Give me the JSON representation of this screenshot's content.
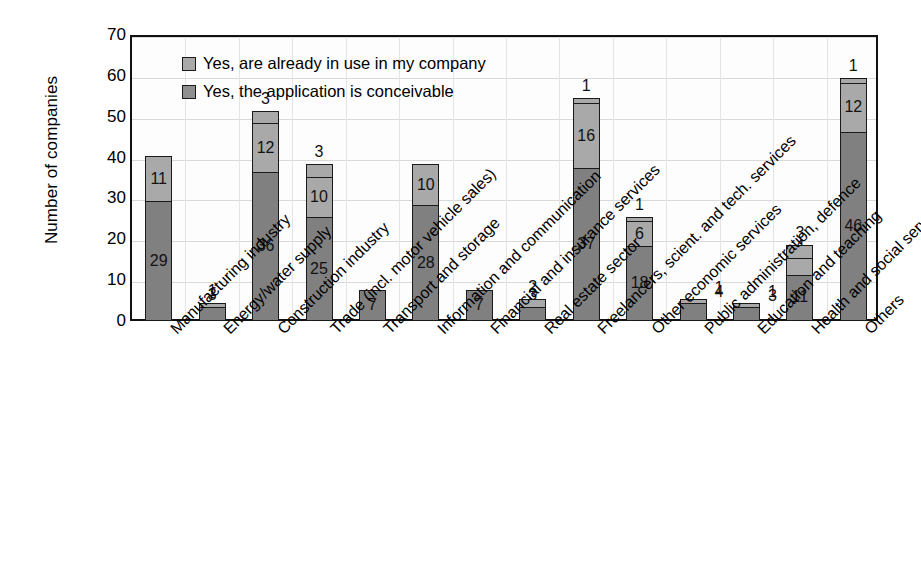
{
  "chart_data": {
    "type": "bar",
    "subtype": "stacked-bar",
    "title": "",
    "xlabel": "",
    "ylabel": "Number of companies",
    "ylim": [
      0,
      70
    ],
    "yticks": [
      0,
      10,
      20,
      30,
      40,
      50,
      60,
      70
    ],
    "grid": true,
    "legend_position": "inside-top-left",
    "categories": [
      "Manufacturing industry",
      "Energy/water supply",
      "Construction industry",
      "Trade (incl. motor vehicle sales)",
      "Transport and storage",
      "Information and communication",
      "Financial and insurance services",
      "Real estate sector",
      "Freelancers, scient. and tech. services",
      "Other economic services",
      "Public administration, defence",
      "Education and teaching",
      "Health and social services",
      "Others"
    ],
    "series": [
      {
        "name": "Yes, the application is conceivable",
        "color": "#808080",
        "values": [
          29,
          3,
          36,
          25,
          7,
          28,
          7,
          3,
          37,
          18,
          4,
          3,
          11,
          46
        ]
      },
      {
        "name": "Yes, are already in use in my company",
        "color": "#a9a9a9",
        "values": [
          11,
          1,
          12,
          10,
          0,
          10,
          0,
          2,
          16,
          6,
          1,
          1,
          4,
          12
        ]
      },
      {
        "name": "Third segment",
        "color": "#a9a9a9",
        "values": [
          0,
          0,
          3,
          3,
          0,
          0,
          0,
          0,
          1,
          1,
          0,
          0,
          3,
          1
        ]
      }
    ],
    "bar_labels": [
      [
        "29",
        "11",
        ""
      ],
      [
        "3",
        "1",
        ""
      ],
      [
        "36",
        "12",
        "3"
      ],
      [
        "25",
        "10",
        "3"
      ],
      [
        "7",
        "",
        ""
      ],
      [
        "28",
        "10",
        ""
      ],
      [
        "7",
        "",
        ""
      ],
      [
        "3",
        "2",
        ""
      ],
      [
        "37",
        "16",
        "1"
      ],
      [
        "18",
        "6",
        "1"
      ],
      [
        "4",
        "1",
        ""
      ],
      [
        "3",
        "1",
        ""
      ],
      [
        "11",
        "4",
        "3"
      ],
      [
        "46",
        "12",
        "1"
      ]
    ]
  },
  "legend": {
    "items": [
      {
        "label": "Yes, are already in use in my company",
        "swatch": "light"
      },
      {
        "label": "Yes, the application is conceivable",
        "swatch": "dark"
      }
    ]
  },
  "axis": {
    "y_title": "Number of companies",
    "y_ticks": [
      "70",
      "60",
      "50",
      "40",
      "30",
      "20",
      "10",
      "0"
    ]
  },
  "colors": {
    "dark_segment": "#808080",
    "light_segment": "#a9a9a9",
    "axis": "#111111",
    "gridline": "#d9d9d9",
    "background": "#ffffff"
  }
}
